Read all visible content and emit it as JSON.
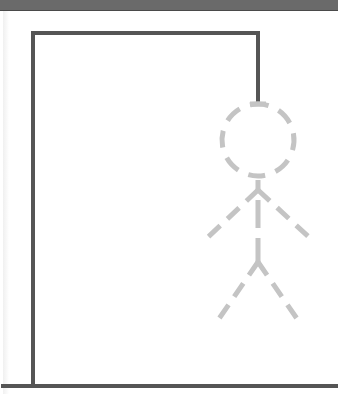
{
  "game": {
    "name": "hangman",
    "colors": {
      "background": "#ffffff",
      "top_bar": "#6a6a6a",
      "gallows": "#555555",
      "figure_outline": "#c4c4c4"
    },
    "gallows": {
      "ground": {
        "x1": 3,
        "y1": 386,
        "x2": 338,
        "y2": 386
      },
      "post": {
        "x1": 33,
        "y1": 386,
        "x2": 33,
        "y2": 33
      },
      "beam": {
        "x1": 33,
        "y1": 33,
        "x2": 258,
        "y2": 33
      },
      "rope": {
        "x1": 258,
        "y1": 33,
        "x2": 258,
        "y2": 103
      }
    },
    "figure": {
      "state": "outline-placeholder",
      "head": {
        "cx": 258,
        "cy": 140,
        "r": 36
      },
      "body": {
        "x1": 258,
        "y1": 178,
        "x2": 258,
        "y2": 258
      },
      "left_arm": {
        "x1": 258,
        "y1": 190,
        "x2": 205,
        "y2": 240
      },
      "right_arm": {
        "x1": 258,
        "y1": 190,
        "x2": 312,
        "y2": 240
      },
      "left_leg": {
        "x1": 258,
        "y1": 262,
        "x2": 214,
        "y2": 326
      },
      "right_leg": {
        "x1": 258,
        "y1": 262,
        "x2": 302,
        "y2": 326
      }
    }
  }
}
